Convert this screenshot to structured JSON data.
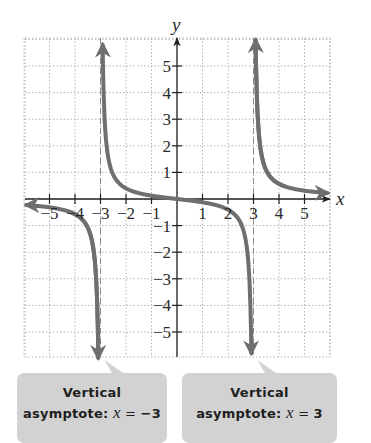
{
  "chart_data": {
    "type": "line",
    "title": "",
    "function": "f(x) = x / (x^2 - 9)",
    "xlabel": "x",
    "ylabel": "y",
    "xlim": [
      -5.9,
      5.9
    ],
    "ylim": [
      -6.2,
      6.3
    ],
    "grid": true,
    "x_ticks": [
      -5,
      -4,
      -3,
      -2,
      -1,
      1,
      2,
      3,
      4,
      5
    ],
    "y_ticks": [
      -5,
      -4,
      -3,
      -2,
      -1,
      1,
      2,
      3,
      4,
      5
    ],
    "x_tick_labels": [
      "−5",
      "−4",
      "−3",
      "−2",
      "−1",
      "1",
      "2",
      "3",
      "4",
      "5"
    ],
    "y_tick_labels": [
      "−5",
      "−4",
      "−3",
      "−2",
      "−1",
      "1",
      "2",
      "3",
      "4",
      "5"
    ],
    "asymptotes": [
      {
        "type": "vertical",
        "x": -3,
        "style": "dashed"
      },
      {
        "type": "vertical",
        "x": 3,
        "style": "dashed"
      }
    ],
    "series": [
      {
        "name": "branch-left",
        "x": [
          -5.7,
          -5,
          -4.5,
          -4,
          -3.6,
          -3.3,
          -3.15,
          -3.08
        ],
        "y": [
          -0.24,
          -0.31,
          -0.4,
          -0.57,
          -0.91,
          -1.75,
          -3.41,
          -6.2
        ]
      },
      {
        "name": "branch-middle",
        "x": [
          -2.93,
          -2.85,
          -2.7,
          -2.5,
          -2,
          -1,
          0,
          1,
          2,
          2.5,
          2.7,
          2.85,
          2.93
        ],
        "y": [
          6.2,
          3.26,
          1.58,
          0.91,
          0.4,
          0.125,
          0,
          -0.125,
          -0.4,
          -0.91,
          -1.58,
          -3.26,
          -6.2
        ]
      },
      {
        "name": "branch-right",
        "x": [
          3.08,
          3.15,
          3.3,
          3.6,
          4,
          4.5,
          5,
          5.7
        ],
        "y": [
          6.2,
          3.41,
          1.75,
          0.91,
          0.57,
          0.4,
          0.31,
          0.24
        ]
      }
    ],
    "annotations": [
      {
        "text": "Vertical asymptote: x = −3",
        "points_to_x": -3
      },
      {
        "text": "Vertical asymptote: x = 3",
        "points_to_x": 3
      }
    ]
  },
  "colors": {
    "curve": "#6f6f6f",
    "grid": "#b4b4b4",
    "axis": "#222222",
    "asymptote": "#8a8a8a",
    "callout_bg": "#d2d2d2"
  },
  "callouts": [
    {
      "line1": "Vertical",
      "prefix": "asymptote: ",
      "var": "x",
      "eq": " = ",
      "value": "−3"
    },
    {
      "line1": "Vertical",
      "prefix": "asymptote: ",
      "var": "x",
      "eq": " = ",
      "value": "3"
    }
  ]
}
